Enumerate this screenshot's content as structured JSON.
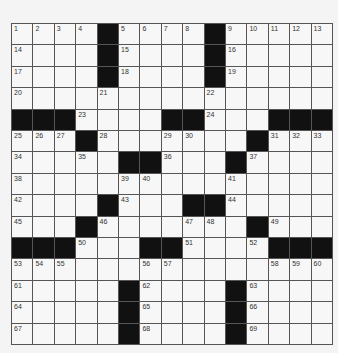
{
  "puzzle": {
    "rows": 15,
    "cols": 15,
    "grid": [
      [
        "1",
        "2",
        "3",
        "4",
        "#",
        "5",
        "6",
        "7",
        "8",
        "#",
        "9",
        "10",
        "11",
        "12",
        "13"
      ],
      [
        "14",
        "",
        "",
        "",
        "#",
        "15",
        "",
        "",
        "",
        "#",
        "16",
        "",
        "",
        "",
        ""
      ],
      [
        "17",
        "",
        "",
        "",
        "#",
        "18",
        "",
        "",
        "",
        "#",
        "19",
        "",
        "",
        "",
        ""
      ],
      [
        "20",
        "",
        "",
        "",
        "21",
        "",
        "",
        "",
        "",
        "22",
        "",
        "",
        "",
        "",
        ""
      ],
      [
        "#",
        "#",
        "#",
        "23",
        "",
        "",
        "",
        "#",
        "#",
        "24",
        "",
        "",
        "#",
        "#",
        "#"
      ],
      [
        "25",
        "26",
        "27",
        "#",
        "28",
        "",
        "",
        "29",
        "30",
        "",
        "",
        "#",
        "31",
        "32",
        "33"
      ],
      [
        "34",
        "",
        "",
        "35",
        "",
        "#",
        "#",
        "36",
        "",
        "",
        "#",
        "37",
        "",
        "",
        ""
      ],
      [
        "38",
        "",
        "",
        "",
        "",
        "39",
        "40",
        "",
        "",
        "",
        "41",
        "",
        "",
        "",
        ""
      ],
      [
        "42",
        "",
        "",
        "",
        "#",
        "43",
        "",
        "",
        "#",
        "#",
        "44",
        "",
        "",
        "",
        ""
      ],
      [
        "45",
        "",
        "",
        "#",
        "46",
        "",
        "",
        "",
        "47",
        "48",
        "",
        "#",
        "49",
        "",
        ""
      ],
      [
        "#",
        "#",
        "#",
        "50",
        "",
        "",
        "#",
        "#",
        "51",
        "",
        "",
        "52",
        "#",
        "#",
        "#"
      ],
      [
        "53",
        "54",
        "55",
        "",
        "",
        "",
        "56",
        "57",
        "",
        "",
        "",
        "",
        "58",
        "59",
        "60"
      ],
      [
        "61",
        "",
        "",
        "",
        "",
        "#",
        "62",
        "",
        "",
        "",
        "#",
        "63",
        "",
        "",
        ""
      ],
      [
        "64",
        "",
        "",
        "",
        "",
        "#",
        "65",
        "",
        "",
        "",
        "#",
        "66",
        "",
        "",
        ""
      ],
      [
        "67",
        "",
        "",
        "",
        "",
        "#",
        "68",
        "",
        "",
        "",
        "#",
        "69",
        "",
        "",
        ""
      ]
    ],
    "colors": {
      "block": "#111111",
      "cell": "#f7f7f7",
      "line": "#555555",
      "background": "#f4f4f4"
    }
  }
}
